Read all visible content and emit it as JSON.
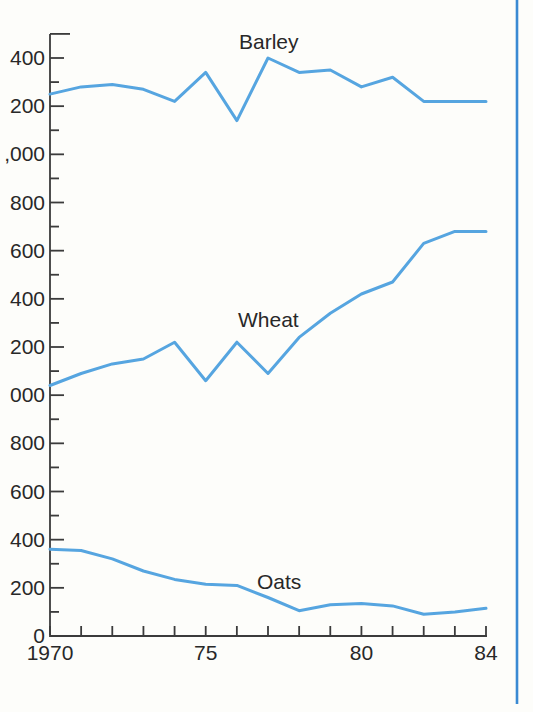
{
  "page": {
    "background": "#fdfdfa",
    "page_edge_rule_color": "#3a8ad3"
  },
  "chart_data": {
    "type": "line",
    "title": "",
    "xlabel": "",
    "ylabel": "",
    "x": [
      1970,
      1971,
      1972,
      1973,
      1974,
      1975,
      1976,
      1977,
      1978,
      1979,
      1980,
      1981,
      1982,
      1983,
      1984
    ],
    "x_axis": {
      "tick_years": [
        1970,
        1971,
        1972,
        1973,
        1974,
        1975,
        1976,
        1977,
        1978,
        1979,
        1980,
        1981,
        1982,
        1983,
        1984
      ],
      "labels": [
        {
          "year": 1970,
          "label": "1970"
        },
        {
          "year": 1975,
          "label": "75"
        },
        {
          "year": 1980,
          "label": "80"
        },
        {
          "year": 1984,
          "label": "84"
        }
      ]
    },
    "y_axis": {
      "min": 0,
      "max": 2500,
      "minor_tick_step": 100,
      "labeled_tick_step": 200,
      "visible_labels": [
        {
          "value": 0,
          "label": "0"
        },
        {
          "value": 200,
          "label": "200"
        },
        {
          "value": 400,
          "label": "400"
        },
        {
          "value": 600,
          "label": "600"
        },
        {
          "value": 800,
          "label": "800"
        },
        {
          "value": 1000,
          "label": "000"
        },
        {
          "value": 1200,
          "label": "200"
        },
        {
          "value": 1400,
          "label": "400"
        },
        {
          "value": 1600,
          "label": "600"
        },
        {
          "value": 1800,
          "label": "800"
        },
        {
          "value": 2000,
          "label": ",000"
        },
        {
          "value": 2200,
          "label": "200"
        },
        {
          "value": 2400,
          "label": "400"
        }
      ]
    },
    "series": [
      {
        "name": "Barley",
        "values": [
          2250,
          2280,
          2290,
          2270,
          2220,
          2340,
          2140,
          2400,
          2340,
          2350,
          2280,
          2320,
          2220,
          2220,
          2220
        ]
      },
      {
        "name": "Wheat",
        "values": [
          1040,
          1090,
          1130,
          1150,
          1220,
          1060,
          1220,
          1090,
          1240,
          1340,
          1420,
          1470,
          1630,
          1680,
          1680
        ]
      },
      {
        "name": "Oats",
        "values": [
          360,
          355,
          320,
          270,
          235,
          215,
          210,
          160,
          105,
          130,
          135,
          125,
          90,
          100,
          115
        ]
      }
    ],
    "line_color": "#56a5e0",
    "axis_color": "#3b3b3b",
    "text_color": "#282828",
    "grid": "off",
    "legend_position": "inline-labels"
  }
}
